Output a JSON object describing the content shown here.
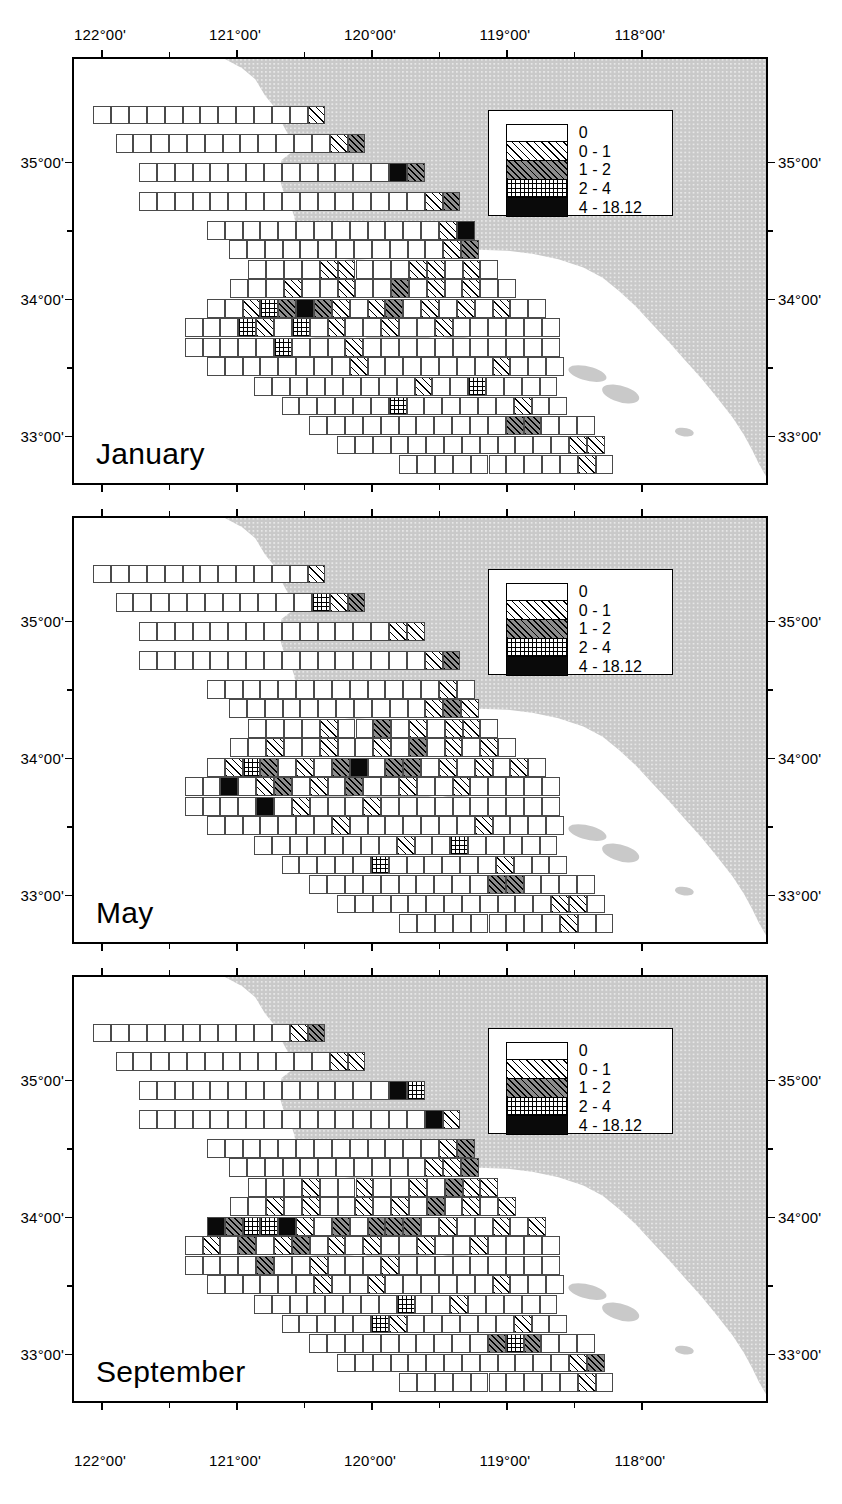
{
  "figure": {
    "type": "map-series"
  },
  "axes": {
    "x_labels": [
      "122°00'",
      "121°00'",
      "120°00'",
      "119°00'",
      "118°00'"
    ],
    "y_labels": [
      "35°00'",
      "34°00'",
      "33°00'"
    ],
    "x_unit": "longitude-west",
    "y_unit": "latitude-north"
  },
  "legend": {
    "entries": [
      {
        "label": "0",
        "pattern": "solid-white",
        "class": "c0"
      },
      {
        "label": "0 - 1",
        "pattern": "diagonal-hatch-light",
        "class": "c1"
      },
      {
        "label": "1 - 2",
        "pattern": "diagonal-hatch-gray",
        "class": "c2"
      },
      {
        "label": "2 - 4",
        "pattern": "cross-hatch",
        "class": "c3"
      },
      {
        "label": "4 - 18.12",
        "pattern": "solid-black",
        "class": "c4"
      }
    ]
  },
  "panels": [
    {
      "id": "january",
      "month": "January"
    },
    {
      "id": "may",
      "month": "May"
    },
    {
      "id": "september",
      "month": "September"
    }
  ],
  "colors": {
    "land_fill": "#c9c9c9",
    "land_stroke": "#3a3a3a",
    "frame": "#000000",
    "cell_stroke": "#4a4a4a",
    "background": "#ffffff"
  },
  "chart_data": {
    "type": "heatmap",
    "title": "",
    "xlabel": "",
    "ylabel": "",
    "categories": [
      "0",
      "0 - 1",
      "1 - 2",
      "2 - 4",
      "4 - 18.12"
    ],
    "legend_position": "inside-upper-right",
    "grid": true,
    "xlim": [
      "122°00'",
      "117°30'"
    ],
    "ylim": [
      "32°30'",
      "35°30'"
    ],
    "series": [
      {
        "name": "January",
        "values": [
          358,
          44,
          9,
          6,
          3
        ]
      },
      {
        "name": "May",
        "values": [
          349,
          52,
          11,
          5,
          5
        ]
      },
      {
        "name": "September",
        "values": [
          341,
          55,
          13,
          8,
          7
        ]
      }
    ]
  }
}
